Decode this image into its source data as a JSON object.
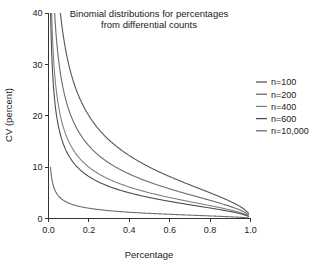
{
  "chart_data": {
    "type": "line",
    "title": "Binomial distributions for percentages from differential counts",
    "title_lines": [
      "Binomial distributions for percentages",
      "from differential counts"
    ],
    "xlabel": "Percentage",
    "ylabel": "CV (percent)",
    "xlim": [
      0.0,
      1.0
    ],
    "ylim": [
      0,
      40
    ],
    "xticks": [
      0.0,
      0.2,
      0.4,
      0.6,
      0.8,
      1.0
    ],
    "xtick_labels": [
      "0.0",
      "0.2",
      "0.4",
      "0.6",
      "0.8",
      "1.0"
    ],
    "yticks": [
      0,
      10,
      20,
      30,
      40
    ],
    "ytick_labels": [
      "0",
      "10",
      "20",
      "30",
      "40"
    ],
    "grid": false,
    "legend_position": "right-outside",
    "formula": "CV = 100 * sqrt((1 - p) / (n * p))",
    "series": [
      {
        "name": "n=100",
        "n": 100,
        "color": "#555555",
        "x": [
          0.01,
          0.02,
          0.04,
          0.06,
          0.08,
          0.1,
          0.15,
          0.2,
          0.25,
          0.3,
          0.35,
          0.4,
          0.45,
          0.5,
          0.55,
          0.6,
          0.65,
          0.7,
          0.75,
          0.8,
          0.85,
          0.9,
          0.95,
          0.98,
          0.99
        ],
        "y": [
          99.5,
          70.0,
          49.0,
          39.58,
          33.91,
          30.0,
          23.8,
          20.0,
          17.32,
          15.28,
          13.63,
          12.25,
          11.06,
          10.0,
          9.05,
          8.16,
          7.34,
          6.55,
          5.77,
          5.0,
          4.2,
          3.33,
          2.29,
          1.43,
          1.0
        ]
      },
      {
        "name": "n=200",
        "n": 200,
        "color": "#6b6b6b",
        "x": [
          0.01,
          0.02,
          0.04,
          0.06,
          0.08,
          0.1,
          0.15,
          0.2,
          0.25,
          0.3,
          0.35,
          0.4,
          0.45,
          0.5,
          0.55,
          0.6,
          0.65,
          0.7,
          0.75,
          0.8,
          0.85,
          0.9,
          0.95,
          0.98,
          0.99
        ],
        "y": [
          70.36,
          49.5,
          34.64,
          27.99,
          23.98,
          21.21,
          16.83,
          14.14,
          12.25,
          10.8,
          9.64,
          8.66,
          7.82,
          7.07,
          6.4,
          5.77,
          5.19,
          4.63,
          4.08,
          3.54,
          2.97,
          2.36,
          1.62,
          1.01,
          0.71
        ]
      },
      {
        "name": "n=400",
        "n": 400,
        "color": "#808080",
        "x": [
          0.01,
          0.02,
          0.04,
          0.06,
          0.08,
          0.1,
          0.15,
          0.2,
          0.25,
          0.3,
          0.35,
          0.4,
          0.45,
          0.5,
          0.55,
          0.6,
          0.65,
          0.7,
          0.75,
          0.8,
          0.85,
          0.9,
          0.95,
          0.98,
          0.99
        ],
        "y": [
          49.75,
          35.0,
          24.49,
          19.79,
          16.96,
          15.0,
          11.9,
          10.0,
          8.66,
          7.64,
          6.82,
          6.12,
          5.53,
          5.0,
          4.52,
          4.08,
          3.67,
          3.27,
          2.89,
          2.5,
          2.1,
          1.67,
          1.15,
          0.71,
          0.5
        ]
      },
      {
        "name": "n=600",
        "n": 600,
        "color": "#4d4d4d",
        "x": [
          0.01,
          0.02,
          0.04,
          0.06,
          0.08,
          0.1,
          0.15,
          0.2,
          0.25,
          0.3,
          0.35,
          0.4,
          0.45,
          0.5,
          0.55,
          0.6,
          0.65,
          0.7,
          0.75,
          0.8,
          0.85,
          0.9,
          0.95,
          0.98,
          0.99
        ],
        "y": [
          40.62,
          28.58,
          20.0,
          16.16,
          13.84,
          12.25,
          9.72,
          8.16,
          7.07,
          6.24,
          5.57,
          5.0,
          4.52,
          4.08,
          3.69,
          3.33,
          3.0,
          2.67,
          2.36,
          2.04,
          1.72,
          1.36,
          0.94,
          0.58,
          0.41
        ]
      },
      {
        "name": "n=10,000",
        "n": 10000,
        "color": "#6e6e6e",
        "x": [
          0.01,
          0.02,
          0.04,
          0.06,
          0.08,
          0.1,
          0.15,
          0.2,
          0.25,
          0.3,
          0.35,
          0.4,
          0.45,
          0.5,
          0.55,
          0.6,
          0.65,
          0.7,
          0.75,
          0.8,
          0.85,
          0.9,
          0.95,
          0.98,
          0.99
        ],
        "y": [
          9.95,
          7.0,
          4.9,
          3.96,
          3.39,
          3.0,
          2.38,
          2.0,
          1.73,
          1.53,
          1.36,
          1.22,
          1.11,
          1.0,
          0.9,
          0.82,
          0.73,
          0.65,
          0.58,
          0.5,
          0.42,
          0.33,
          0.23,
          0.14,
          0.1
        ]
      }
    ]
  },
  "legend": {
    "items": [
      {
        "label": "n=100"
      },
      {
        "label": "n=200"
      },
      {
        "label": "n=400"
      },
      {
        "label": "n=600"
      },
      {
        "label": "n=10,000"
      }
    ]
  }
}
